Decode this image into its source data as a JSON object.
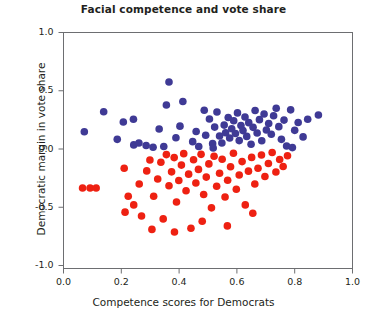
{
  "chart_data": {
    "type": "scatter",
    "title": "Facial competence and vote share",
    "xlabel": "Competence scores for Democrats",
    "ylabel": "Democratic margin in vote share",
    "xlim": [
      0.0,
      1.0
    ],
    "ylim": [
      -1.0,
      1.0
    ],
    "xticks": [
      "0.0",
      "0.2",
      "0.4",
      "0.6",
      "0.8",
      "1.0"
    ],
    "xtick_values": [
      0.0,
      0.2,
      0.4,
      0.6,
      0.8,
      1.0
    ],
    "yticks": [
      "1.0",
      "0.5",
      "0.0",
      "-0.5",
      "-1.0"
    ],
    "ytick_values": [
      1.0,
      0.5,
      0.0,
      -0.5,
      -1.0
    ],
    "grid": false,
    "legend": "none",
    "marker_size": 5.2,
    "series": [
      {
        "name": "Democratic wins",
        "color": "#3f3a95",
        "points": [
          [
            0.072,
            0.148
          ],
          [
            0.139,
            0.32
          ],
          [
            0.186,
            0.083
          ],
          [
            0.207,
            0.232
          ],
          [
            0.243,
            0.035
          ],
          [
            0.261,
            0.051
          ],
          [
            0.286,
            0.03
          ],
          [
            0.31,
            0.015
          ],
          [
            0.331,
            0.172
          ],
          [
            0.347,
            0.022
          ],
          [
            0.356,
            0.378
          ],
          [
            0.365,
            0.575
          ],
          [
            0.389,
            0.097
          ],
          [
            0.403,
            0.196
          ],
          [
            0.413,
            0.408
          ],
          [
            0.447,
            0.063
          ],
          [
            0.459,
            0.15
          ],
          [
            0.468,
            0.022
          ],
          [
            0.492,
            0.118
          ],
          [
            0.505,
            0.258
          ],
          [
            0.516,
            0.046
          ],
          [
            0.523,
            0.188
          ],
          [
            0.531,
            0.318
          ],
          [
            0.54,
            0.112
          ],
          [
            0.548,
            0.052
          ],
          [
            0.556,
            0.205
          ],
          [
            0.561,
            0.14
          ],
          [
            0.57,
            0.27
          ],
          [
            0.575,
            0.094
          ],
          [
            0.582,
            0.174
          ],
          [
            0.589,
            0.243
          ],
          [
            0.595,
            0.133
          ],
          [
            0.602,
            0.31
          ],
          [
            0.608,
            0.072
          ],
          [
            0.614,
            0.201
          ],
          [
            0.621,
            0.158
          ],
          [
            0.628,
            0.275
          ],
          [
            0.634,
            0.108
          ],
          [
            0.641,
            0.226
          ],
          [
            0.649,
            0.041
          ],
          [
            0.656,
            0.186
          ],
          [
            0.663,
            0.33
          ],
          [
            0.67,
            0.137
          ],
          [
            0.678,
            0.252
          ],
          [
            0.686,
            0.071
          ],
          [
            0.694,
            0.3
          ],
          [
            0.702,
            0.163
          ],
          [
            0.71,
            0.219
          ],
          [
            0.719,
            0.126
          ],
          [
            0.727,
            0.286
          ],
          [
            0.736,
            0.35
          ],
          [
            0.745,
            0.192
          ],
          [
            0.754,
            0.083
          ],
          [
            0.763,
            0.248
          ],
          [
            0.772,
            0.026
          ],
          [
            0.786,
            0.336
          ],
          [
            0.8,
            0.16
          ],
          [
            0.812,
            0.228
          ],
          [
            0.829,
            0.104
          ],
          [
            0.845,
            0.255
          ],
          [
            0.882,
            0.292
          ],
          [
            0.792,
            0.012
          ],
          [
            0.487,
            0.332
          ],
          [
            0.242,
            0.255
          ],
          [
            0.518,
            0.008
          ]
        ]
      },
      {
        "name": "Democratic losses",
        "color": "#ee2112",
        "points": [
          [
            0.066,
            -0.335
          ],
          [
            0.092,
            -0.335
          ],
          [
            0.113,
            -0.335
          ],
          [
            0.21,
            -0.165
          ],
          [
            0.224,
            -0.405
          ],
          [
            0.243,
            -0.48
          ],
          [
            0.262,
            -0.3
          ],
          [
            0.27,
            -0.575
          ],
          [
            0.288,
            -0.188
          ],
          [
            0.299,
            -0.095
          ],
          [
            0.312,
            -0.405
          ],
          [
            0.326,
            -0.258
          ],
          [
            0.337,
            -0.114
          ],
          [
            0.345,
            -0.6
          ],
          [
            0.356,
            -0.048
          ],
          [
            0.365,
            -0.315
          ],
          [
            0.374,
            -0.196
          ],
          [
            0.383,
            -0.074
          ],
          [
            0.391,
            -0.455
          ],
          [
            0.399,
            -0.27
          ],
          [
            0.408,
            -0.138
          ],
          [
            0.416,
            -0.04
          ],
          [
            0.424,
            -0.358
          ],
          [
            0.433,
            -0.216
          ],
          [
            0.441,
            -0.68
          ],
          [
            0.45,
            -0.092
          ],
          [
            0.458,
            -0.292
          ],
          [
            0.467,
            -0.175
          ],
          [
            0.476,
            -0.046
          ],
          [
            0.485,
            -0.39
          ],
          [
            0.494,
            -0.241
          ],
          [
            0.503,
            -0.128
          ],
          [
            0.512,
            -0.505
          ],
          [
            0.521,
            -0.062
          ],
          [
            0.53,
            -0.32
          ],
          [
            0.54,
            -0.208
          ],
          [
            0.549,
            -0.088
          ],
          [
            0.559,
            -0.412
          ],
          [
            0.568,
            -0.268
          ],
          [
            0.578,
            -0.152
          ],
          [
            0.588,
            -0.036
          ],
          [
            0.598,
            -0.345
          ],
          [
            0.608,
            -0.223
          ],
          [
            0.618,
            -0.108
          ],
          [
            0.629,
            -0.48
          ],
          [
            0.64,
            -0.19
          ],
          [
            0.651,
            -0.072
          ],
          [
            0.662,
            -0.3
          ],
          [
            0.673,
            -0.165
          ],
          [
            0.685,
            -0.052
          ],
          [
            0.697,
            -0.236
          ],
          [
            0.709,
            -0.124
          ],
          [
            0.722,
            -0.03
          ],
          [
            0.735,
            -0.198
          ],
          [
            0.748,
            -0.09
          ],
          [
            0.76,
            -0.15
          ],
          [
            0.775,
            -0.058
          ],
          [
            0.655,
            -0.552
          ],
          [
            0.384,
            -0.712
          ],
          [
            0.306,
            -0.69
          ],
          [
            0.48,
            -0.62
          ],
          [
            0.567,
            -0.66
          ],
          [
            0.213,
            -0.542
          ]
        ]
      }
    ]
  }
}
